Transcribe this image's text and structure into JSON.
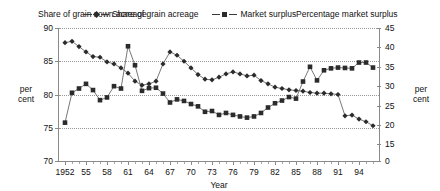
{
  "titles": {
    "left": "Share of grain sown acreage",
    "right": "Percentage market surplus",
    "left_axis_label": "per cent",
    "right_axis_label": "per cent",
    "x_axis_label": "Year"
  },
  "legend": {
    "items": [
      {
        "label": "Share of grain acreage",
        "marker": "diamond-marker",
        "color": "#2b2b2b"
      },
      {
        "label": "Market surplus",
        "marker": "square-marker",
        "color": "#2b2b2b"
      }
    ]
  },
  "axes": {
    "left_ticks": [
      "90",
      "85",
      "80",
      "75",
      "70"
    ],
    "right_ticks": [
      "45",
      "40",
      "35",
      "30",
      "25",
      "20",
      "15",
      "0"
    ],
    "x_ticks": [
      "1952",
      "55",
      "58",
      "61",
      "64",
      "67",
      "70",
      "73",
      "76",
      "79",
      "82",
      "85",
      "88",
      "91",
      "94"
    ]
  },
  "chart_data": {
    "type": "line",
    "xlabel": "Year",
    "ylabel": "per cent",
    "grid": true,
    "legend_position": "top-center",
    "x": [
      1952,
      1953,
      1954,
      1955,
      1956,
      1957,
      1958,
      1959,
      1960,
      1961,
      1962,
      1963,
      1964,
      1965,
      1966,
      1967,
      1968,
      1969,
      1970,
      1971,
      1972,
      1973,
      1974,
      1975,
      1976,
      1977,
      1978,
      1979,
      1980,
      1981,
      1982,
      1983,
      1984,
      1985,
      1986,
      1987,
      1988,
      1989,
      1990,
      1991,
      1992,
      1993,
      1994,
      1995,
      1996
    ],
    "series": [
      {
        "name": "Share of grain acreage",
        "axis": "left",
        "ylabel": "per cent",
        "ylim": [
          70,
          90
        ],
        "values": [
          87.8,
          88.0,
          87.2,
          86.4,
          85.7,
          85.6,
          84.9,
          84.6,
          84.0,
          83.2,
          82.0,
          81.4,
          81.6,
          82.0,
          84.6,
          86.4,
          85.9,
          85.0,
          84.0,
          83.0,
          82.3,
          82.2,
          82.6,
          83.1,
          83.4,
          83.1,
          82.8,
          82.9,
          82.1,
          81.6,
          81.1,
          80.9,
          80.7,
          80.6,
          80.5,
          80.3,
          80.2,
          80.2,
          80.1,
          80.0,
          76.8,
          76.9,
          76.3,
          75.9,
          75.3
        ]
      },
      {
        "name": "Market surplus",
        "axis": "right",
        "ylabel": "per cent",
        "ylim": [
          15,
          45
        ],
        "values": [
          20.6,
          28.3,
          29.4,
          30.6,
          29.0,
          26.4,
          27.1,
          30.0,
          29.4,
          40.3,
          35.4,
          28.8,
          29.5,
          29.6,
          28.1,
          25.8,
          26.6,
          26.2,
          25.4,
          24.8,
          23.4,
          23.6,
          22.6,
          23.1,
          22.6,
          22.2,
          21.9,
          22.2,
          23.1,
          24.5,
          25.6,
          26.3,
          27.2,
          26.8,
          31.2,
          35.0,
          31.5,
          34.1,
          34.6,
          34.8,
          34.7,
          34.6,
          36.1,
          36.1,
          34.8
        ]
      }
    ]
  }
}
